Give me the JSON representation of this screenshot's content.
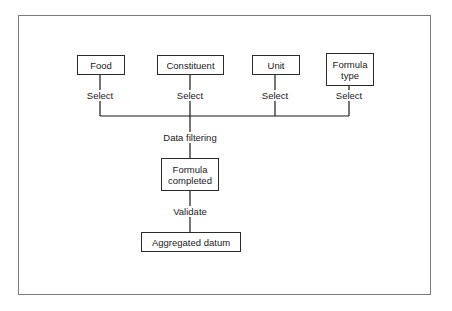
{
  "diagram": {
    "inputs": [
      {
        "label": "Food",
        "edge_label": "Select"
      },
      {
        "label": "Constituent",
        "edge_label": "Select"
      },
      {
        "label": "Unit",
        "edge_label": "Select"
      },
      {
        "label": "Formula type",
        "edge_label": "Select"
      }
    ],
    "merge_label": "Data filtering",
    "middle_node": "Formula completed",
    "middle_edge_label": "Validate",
    "final_node": "Aggregated datum"
  }
}
